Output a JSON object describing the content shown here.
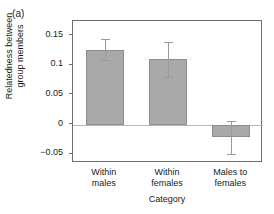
{
  "panel": {
    "label": "(a)"
  },
  "chart_data": {
    "type": "bar",
    "title": "",
    "subtitle": "",
    "xlabel": "Category",
    "ylabel_line1": "Relatedness between",
    "ylabel_line2": "group members",
    "categories": [
      "Within males",
      "Within females",
      "Males to females"
    ],
    "category_lines": [
      {
        "line1": "Within",
        "line2": "males"
      },
      {
        "line1": "Within",
        "line2": "females"
      },
      {
        "line1": "Males to",
        "line2": "females"
      }
    ],
    "values": [
      0.126,
      0.111,
      -0.021
    ],
    "error_low": [
      0.109,
      0.081,
      -0.05
    ],
    "error_high": [
      0.144,
      0.14,
      0.006
    ],
    "ylim": [
      -0.065,
      0.175
    ],
    "yticks": [
      0.15,
      0.1,
      0.05,
      0,
      -0.05
    ],
    "ytick_labels": [
      "0.15",
      "0.1",
      "0.05",
      "0",
      "−0.05"
    ],
    "grid": false,
    "legend": "none",
    "zero_line": true,
    "bar_color": "#a9a9a9",
    "bar_edge_color": "#8d8d8d",
    "error_color": "#9a9a9a",
    "axis_color": "#6e6e6e",
    "background": "#ffffff"
  }
}
